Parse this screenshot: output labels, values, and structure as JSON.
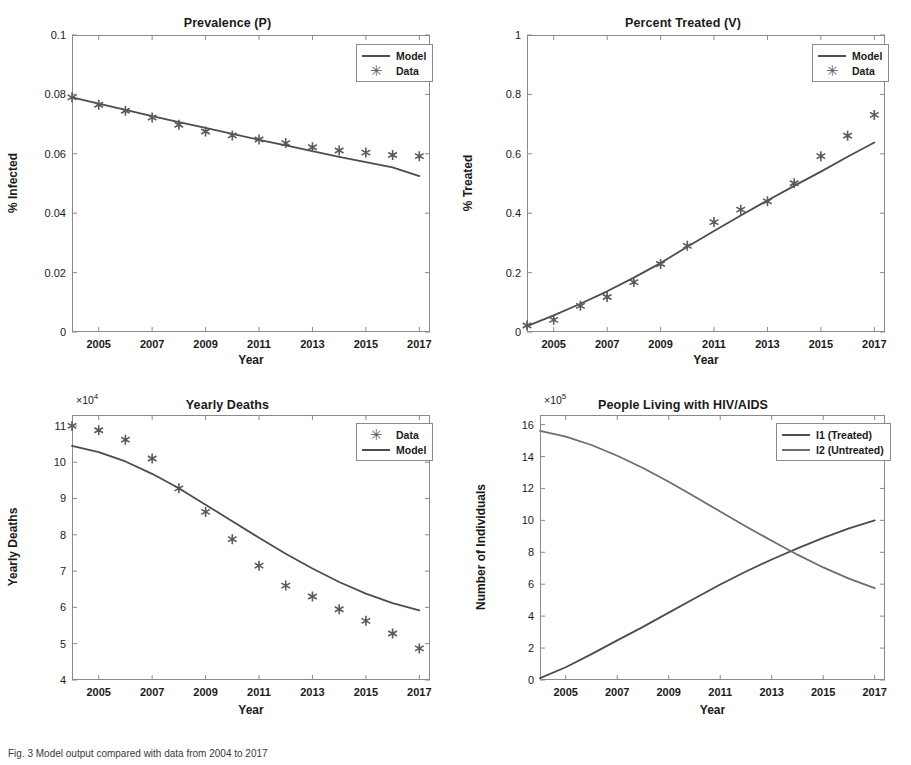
{
  "figure": {
    "caption": "Fig. 3 Model output compared with data from 2004 to 2017",
    "background": "#ffffff",
    "model_color": "#4d4d4d",
    "data_color": "#5a5a5a",
    "axis_color": "#8a8a8a"
  },
  "chart_data": [
    {
      "id": "prevalence",
      "type": "line",
      "title": "Prevalence (P)",
      "xlabel": "Year",
      "ylabel": "% Infected",
      "xlim": [
        2004,
        2017.4
      ],
      "ylim": [
        0,
        0.1
      ],
      "xticks": [
        2005,
        2007,
        2009,
        2011,
        2013,
        2015,
        2017
      ],
      "xticklabels": [
        "2005",
        "2007",
        "2009",
        "2011",
        "2013",
        "2015",
        "2017"
      ],
      "yticks": [
        0,
        0.02,
        0.04,
        0.06,
        0.08,
        0.1
      ],
      "yticklabels": [
        "0",
        "0.02",
        "0.04",
        "0.06",
        "0.08",
        "0.1"
      ],
      "grid": false,
      "legend": {
        "position": "top-right",
        "entries": [
          {
            "label": "Model",
            "marker": "line"
          },
          {
            "label": "Data",
            "marker": "star"
          }
        ]
      },
      "series": [
        {
          "name": "Model",
          "marker": "line",
          "x": [
            2004,
            2005,
            2006,
            2007,
            2008,
            2009,
            2010,
            2011,
            2012,
            2013,
            2014,
            2015,
            2016,
            2017
          ],
          "values": [
            0.079,
            0.0769,
            0.0748,
            0.0727,
            0.0707,
            0.0687,
            0.0667,
            0.0647,
            0.0628,
            0.0609,
            0.059,
            0.0572,
            0.0554,
            0.0525
          ]
        },
        {
          "name": "Data",
          "marker": "star",
          "x": [
            2004,
            2005,
            2006,
            2007,
            2008,
            2009,
            2010,
            2011,
            2012,
            2013,
            2014,
            2015,
            2016,
            2017
          ],
          "values": [
            0.079,
            0.0765,
            0.0745,
            0.0722,
            0.0698,
            0.0675,
            0.0662,
            0.0648,
            0.0636,
            0.0622,
            0.0611,
            0.0604,
            0.0596,
            0.0592
          ]
        }
      ]
    },
    {
      "id": "percent-treated",
      "type": "line",
      "title": "Percent Treated (V)",
      "xlabel": "Year",
      "ylabel": "% Treated",
      "xlim": [
        2004,
        2017.4
      ],
      "ylim": [
        0,
        1
      ],
      "xticks": [
        2005,
        2007,
        2009,
        2011,
        2013,
        2015,
        2017
      ],
      "xticklabels": [
        "2005",
        "2007",
        "2009",
        "2011",
        "2013",
        "2015",
        "2017"
      ],
      "yticks": [
        0,
        0.2,
        0.4,
        0.6,
        0.8,
        1
      ],
      "yticklabels": [
        "0",
        "0.2",
        "0.4",
        "0.6",
        "0.8",
        "1"
      ],
      "grid": false,
      "legend": {
        "position": "top-right",
        "entries": [
          {
            "label": "Model",
            "marker": "line"
          },
          {
            "label": "Data",
            "marker": "star"
          }
        ]
      },
      "series": [
        {
          "name": "Model",
          "marker": "line",
          "x": [
            2004,
            2005,
            2006,
            2007,
            2008,
            2009,
            2010,
            2011,
            2012,
            2013,
            2014,
            2015,
            2016,
            2017
          ],
          "values": [
            0.02,
            0.056,
            0.095,
            0.137,
            0.183,
            0.232,
            0.287,
            0.34,
            0.392,
            0.443,
            0.492,
            0.54,
            0.59,
            0.638
          ]
        },
        {
          "name": "Data",
          "marker": "star",
          "x": [
            2004,
            2005,
            2006,
            2007,
            2008,
            2009,
            2010,
            2011,
            2012,
            2013,
            2014,
            2015,
            2016,
            2017
          ],
          "values": [
            0.022,
            0.041,
            0.088,
            0.118,
            0.168,
            0.229,
            0.29,
            0.37,
            0.412,
            0.44,
            0.501,
            0.592,
            0.661,
            0.731
          ]
        }
      ]
    },
    {
      "id": "yearly-deaths",
      "type": "line",
      "title": "Yearly Deaths",
      "xlabel": "Year",
      "ylabel": "Yearly Deaths",
      "y_exponent": "10",
      "y_exponent_power": "4",
      "xlim": [
        2004,
        2017.4
      ],
      "ylim": [
        4,
        11.3
      ],
      "xticks": [
        2005,
        2007,
        2009,
        2011,
        2013,
        2015,
        2017
      ],
      "xticklabels": [
        "2005",
        "2007",
        "2009",
        "2011",
        "2013",
        "2015",
        "2017"
      ],
      "yticks": [
        4,
        5,
        6,
        7,
        8,
        9,
        10,
        11
      ],
      "yticklabels": [
        "4",
        "5",
        "6",
        "7",
        "8",
        "9",
        "10",
        "11"
      ],
      "grid": false,
      "legend": {
        "position": "top-right",
        "entries": [
          {
            "label": "Data",
            "marker": "star"
          },
          {
            "label": "Model",
            "marker": "line"
          }
        ]
      },
      "series": [
        {
          "name": "Data",
          "marker": "star",
          "x": [
            2004,
            2005,
            2006,
            2007,
            2008,
            2009,
            2010,
            2011,
            2012,
            2013,
            2014,
            2015,
            2016,
            2017
          ],
          "values": [
            11.0,
            10.88,
            10.62,
            10.1,
            9.28,
            8.63,
            7.88,
            7.15,
            6.6,
            6.3,
            5.95,
            5.63,
            5.28,
            4.87
          ]
        },
        {
          "name": "Model",
          "marker": "line",
          "x": [
            2004,
            2005,
            2006,
            2007,
            2008,
            2009,
            2010,
            2011,
            2012,
            2013,
            2014,
            2015,
            2016,
            2017
          ],
          "values": [
            10.45,
            10.28,
            10.02,
            9.68,
            9.28,
            8.83,
            8.37,
            7.92,
            7.48,
            7.07,
            6.7,
            6.38,
            6.12,
            5.92
          ]
        }
      ]
    },
    {
      "id": "people-living-with-hiv-aids",
      "type": "line",
      "title": "People Living with HIV/AIDS",
      "xlabel": "Year",
      "ylabel": "Number of Individuals",
      "y_exponent": "10",
      "y_exponent_power": "5",
      "xlim": [
        2004,
        2017.4
      ],
      "ylim": [
        0,
        16.6
      ],
      "xticks": [
        2005,
        2007,
        2009,
        2011,
        2013,
        2015,
        2017
      ],
      "xticklabels": [
        "2005",
        "2007",
        "2009",
        "2011",
        "2013",
        "2015",
        "2017"
      ],
      "yticks": [
        0,
        2,
        4,
        6,
        8,
        10,
        12,
        14,
        16
      ],
      "yticklabels": [
        "0",
        "2",
        "4",
        "6",
        "8",
        "10",
        "12",
        "14",
        "16"
      ],
      "grid": false,
      "legend": {
        "position": "top-right",
        "entries": [
          {
            "label": "I1 (Treated)",
            "marker": "line"
          },
          {
            "label": "I2 (Untreated)",
            "marker": "line-alt"
          }
        ]
      },
      "series": [
        {
          "name": "I1 (Treated)",
          "marker": "line",
          "x": [
            2004,
            2005,
            2006,
            2007,
            2008,
            2009,
            2010,
            2011,
            2012,
            2013,
            2014,
            2015,
            2016,
            2017
          ],
          "values": [
            0.12,
            0.8,
            1.62,
            2.48,
            3.33,
            4.22,
            5.1,
            5.98,
            6.8,
            7.55,
            8.25,
            8.9,
            9.5,
            10.0
          ]
        },
        {
          "name": "I2 (Untreated)",
          "marker": "line-alt",
          "x": [
            2004,
            2005,
            2006,
            2007,
            2008,
            2009,
            2010,
            2011,
            2012,
            2013,
            2014,
            2015,
            2016,
            2017
          ],
          "values": [
            15.6,
            15.25,
            14.72,
            14.05,
            13.28,
            12.42,
            11.5,
            10.55,
            9.62,
            8.72,
            7.85,
            7.05,
            6.35,
            5.75
          ]
        }
      ]
    }
  ]
}
